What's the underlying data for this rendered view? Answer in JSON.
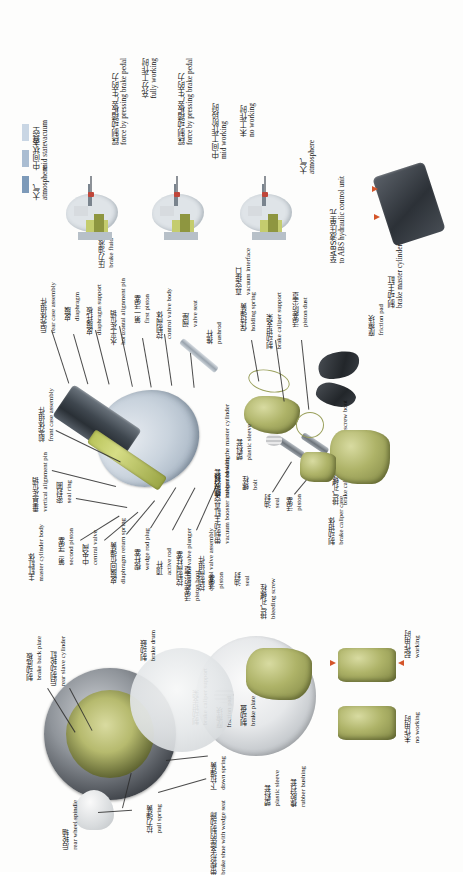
{
  "figure": {
    "domain": "technical-exploded-diagram",
    "subject_cn": "汽车制动系统",
    "subject_en": "automobile brake system",
    "orientation": "text rotated 90 degrees counter-clockwise (reads bottom-to-top)"
  },
  "legend": {
    "items": [
      {
        "cn": "真空",
        "en": "vacuum",
        "color": "#c9d6e4"
      },
      {
        "cn": "中间状态",
        "en": "mid state",
        "color": "#aabdd2"
      },
      {
        "cn": "大气",
        "en": "atmosphere",
        "color": "#7d9ab9"
      }
    ]
  },
  "states": [
    {
      "cn": "踩制动踏板产生的力",
      "en": "force by pressing brake pedal",
      "cn2": "充分工作时",
      "en2": "fully working"
    },
    {
      "cn": "踩制动踏板产生的力",
      "en": "force by pressing brake pedal",
      "cn2": "中间工作阶段时",
      "en2": "mid working"
    },
    {
      "cn": "",
      "en": "",
      "cn2": "未工作时",
      "en2": "no working"
    }
  ],
  "top_right": {
    "atmosphere_cn": "大气",
    "atmosphere_en": "atmosphere",
    "abs_cn": "至ABS液压单元",
    "abs_en": "to ABS hydraulic control unit",
    "master_cyl_cn": "制动主缸",
    "master_cyl_en": "brake master cylinder",
    "vacuum_interface_cn": "真空接口",
    "vacuum_interface_en": "vacuum interface",
    "brake_fluid_cn": "压力油液",
    "brake_fluid_en": "brake fluid"
  },
  "booster_labels": [
    {
      "cn": "后壳体组件",
      "en": "rear case assembly"
    },
    {
      "cn": "皮膜",
      "en": "diaphragm"
    },
    {
      "cn": "皮膜托板",
      "en": "diaphragm support"
    },
    {
      "cn": "水平定位销",
      "en": "horizontal alignment pin"
    },
    {
      "cn": "第一活塞",
      "en": "first piston"
    },
    {
      "cn": "控制阀体",
      "en": "control valve body"
    },
    {
      "cn": "阀座",
      "en": "valve seat"
    },
    {
      "cn": "推杆",
      "en": "pushrod"
    }
  ],
  "master_cyl_labels": [
    {
      "cn": "前壳体组件",
      "en": "front case assembly"
    },
    {
      "cn": "垂直定位销",
      "en": "vertical alignment pin"
    },
    {
      "cn": "密封圈",
      "en": "seal ring"
    },
    {
      "cn": "主缸缸体",
      "en": "master cylinder body"
    },
    {
      "cn": "第二活塞",
      "en": "second piston"
    },
    {
      "cn": "中央阀",
      "en": "central valve"
    },
    {
      "cn": "皮膜回位弹簧",
      "en": "diaphragm return spring"
    },
    {
      "cn": "楔杆塞",
      "en": "wedge rod plug"
    },
    {
      "cn": "顶杆",
      "en": "active rod"
    },
    {
      "cn": "控制阀柱塞",
      "en": "control valve plunger"
    },
    {
      "cn": "控制阀组件",
      "en": "control valve assembly"
    },
    {
      "cn": "带制动主缸真空助力器",
      "en": "vacuum booster integrated with the master cylinder"
    }
  ],
  "caliper_labels": [
    {
      "cn": "保持弹簧",
      "en": "holding spring"
    },
    {
      "cn": "制动钳支架",
      "en": "brake caliper support"
    },
    {
      "cn": "活塞防尘罩",
      "en": "piston dust"
    },
    {
      "cn": "摩擦块",
      "en": "friction pad"
    },
    {
      "cn": "排气孔螺栓防尘罩",
      "en": "brake caliper case bleeding screw boot"
    },
    {
      "cn": "塑料套",
      "en": "plastic sleeve"
    },
    {
      "cn": "橡胶衬套",
      "en": "rubber bushing"
    },
    {
      "cn": "螺栓",
      "en": "bolt"
    },
    {
      "cn": "油封",
      "en": "seal"
    },
    {
      "cn": "活塞",
      "en": "piston"
    },
    {
      "cn": "制动钳体",
      "en": "brake caliper case"
    }
  ],
  "lower_labels": [
    {
      "cn": "活塞防尘罩",
      "en": "piston boot"
    },
    {
      "cn": "活塞",
      "en": "piston"
    },
    {
      "cn": "油封",
      "en": "seal"
    },
    {
      "cn": "排气孔螺栓",
      "en": "bleeding screw"
    },
    {
      "cn": "制动钳支架",
      "en": "brake caliper support"
    },
    {
      "cn": "摩擦块",
      "en": "friction pad"
    },
    {
      "cn": "制动盘",
      "en": "brake plate"
    },
    {
      "cn": "塑料套",
      "en": "plastic sleeve"
    },
    {
      "cn": "橡胶衬套",
      "en": "rubber bushing"
    },
    {
      "cn": "起作用时",
      "en": "working"
    },
    {
      "cn": "未作用时",
      "en": "no working"
    }
  ],
  "drum_labels": [
    {
      "cn": "制动底板",
      "en": "brake back plate"
    },
    {
      "cn": "后制动轮缸",
      "en": "rear slave cylinder"
    },
    {
      "cn": "制动鼓",
      "en": "brake drum"
    },
    {
      "cn": "后轮轴",
      "en": "rear wheel spindle"
    },
    {
      "cn": "拉力弹簧",
      "en": "pull spring"
    },
    {
      "cn": "下拉弹簧",
      "en": "down spring"
    },
    {
      "cn": "带楔形支座的制动蹄",
      "en": "brake shoe with wedge seat"
    }
  ]
}
